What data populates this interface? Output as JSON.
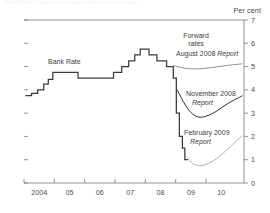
{
  "top_partial_text": "Chart  Bank Rate and forward market interest rates",
  "axis": {
    "unit_label": "Per cent",
    "y_ticks": [
      0,
      1,
      2,
      3,
      4,
      5,
      6,
      7
    ],
    "x_ticks": [
      "2004",
      "05",
      "06",
      "07",
      "08",
      "09",
      "10"
    ]
  },
  "annotations": {
    "bank_rate": "Bank Rate",
    "forward_line1": "Forward",
    "forward_line2": "rates",
    "august_plain": "August 2008 ",
    "august_italic": "Report",
    "november_plain": "November 2008",
    "november_italic": "Report",
    "february_plain": "February 2009",
    "february_italic": "Report"
  },
  "colors": {
    "bank_rate": "#3a3a3a",
    "august": "#8d8d8d",
    "november": "#2f2f2f",
    "february": "#b0b0b0",
    "axis": "#777777",
    "text": "#4a4a4a"
  },
  "chart_data": {
    "type": "line",
    "title": "Bank Rate and forward market interest rates",
    "xlabel": "",
    "ylabel": "Per cent",
    "ylim": [
      0,
      7
    ],
    "xlim": [
      2003.5,
      2010.75
    ],
    "grid": false,
    "legend": "inline-annotations",
    "series": [
      {
        "name": "Bank Rate",
        "style": "step",
        "color": "#3a3a3a",
        "points": [
          [
            2003.55,
            3.75
          ],
          [
            2003.75,
            3.75
          ],
          [
            2003.75,
            3.85
          ],
          [
            2003.95,
            3.85
          ],
          [
            2003.95,
            4.0
          ],
          [
            2004.15,
            4.0
          ],
          [
            2004.15,
            4.25
          ],
          [
            2004.3,
            4.25
          ],
          [
            2004.3,
            4.45
          ],
          [
            2004.45,
            4.45
          ],
          [
            2004.45,
            4.75
          ],
          [
            2005.28,
            4.75
          ],
          [
            2005.28,
            4.5
          ],
          [
            2006.45,
            4.5
          ],
          [
            2006.45,
            4.75
          ],
          [
            2006.72,
            4.75
          ],
          [
            2006.72,
            5.0
          ],
          [
            2006.95,
            5.0
          ],
          [
            2006.95,
            5.25
          ],
          [
            2007.15,
            5.25
          ],
          [
            2007.15,
            5.5
          ],
          [
            2007.33,
            5.5
          ],
          [
            2007.33,
            5.75
          ],
          [
            2007.62,
            5.75
          ],
          [
            2007.62,
            5.5
          ],
          [
            2007.88,
            5.5
          ],
          [
            2007.88,
            5.25
          ],
          [
            2008.2,
            5.25
          ],
          [
            2008.2,
            5.0
          ],
          [
            2008.42,
            5.0
          ],
          [
            2008.42,
            4.5
          ],
          [
            2008.52,
            4.5
          ],
          [
            2008.52,
            3.0
          ],
          [
            2008.62,
            3.0
          ],
          [
            2008.62,
            2.0
          ],
          [
            2008.72,
            2.0
          ],
          [
            2008.72,
            1.5
          ],
          [
            2008.8,
            1.5
          ],
          [
            2008.8,
            1.0
          ],
          [
            2008.9,
            1.0
          ]
        ]
      },
      {
        "name": "Forward rates August 2008 Report",
        "style": "smooth",
        "color": "#8d8d8d",
        "points": [
          [
            2008.42,
            5.05
          ],
          [
            2008.8,
            4.93
          ],
          [
            2009.2,
            4.9
          ],
          [
            2009.7,
            4.96
          ],
          [
            2010.2,
            5.05
          ],
          [
            2010.7,
            5.12
          ]
        ]
      },
      {
        "name": "Forward rates November 2008 Report",
        "style": "smooth",
        "color": "#2f2f2f",
        "points": [
          [
            2008.55,
            4.0
          ],
          [
            2008.75,
            3.5
          ],
          [
            2008.95,
            3.1
          ],
          [
            2009.2,
            2.85
          ],
          [
            2009.45,
            2.85
          ],
          [
            2009.8,
            3.05
          ],
          [
            2010.2,
            3.4
          ],
          [
            2010.7,
            3.75
          ]
        ]
      },
      {
        "name": "Forward rates February 2009 Report",
        "style": "smooth",
        "color": "#b0b0b0",
        "points": [
          [
            2008.88,
            1.1
          ],
          [
            2009.05,
            0.85
          ],
          [
            2009.25,
            0.75
          ],
          [
            2009.5,
            0.8
          ],
          [
            2009.85,
            1.05
          ],
          [
            2010.25,
            1.5
          ],
          [
            2010.7,
            2.05
          ]
        ]
      }
    ]
  }
}
